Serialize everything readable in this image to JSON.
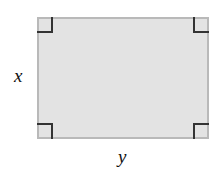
{
  "diagram": {
    "shape": "rectangle",
    "fill_color": "#e3e3e3",
    "border_color": "#b9b9b9",
    "right_angle_markers": 4,
    "labels": {
      "height": "x",
      "width": "y"
    }
  }
}
